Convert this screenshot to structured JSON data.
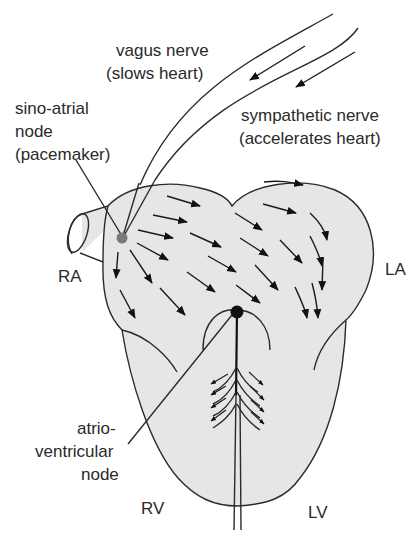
{
  "diagram": {
    "labels": {
      "vagus_line1": "vagus nerve",
      "vagus_line2": "(slows heart)",
      "sympathetic_line1": "sympathetic nerve",
      "sympathetic_line2": "(accelerates heart)",
      "sa_line1": "sino-atrial",
      "sa_line2": "node",
      "sa_line3": "(pacemaker)",
      "ra": "RA",
      "la": "LA",
      "av_line1": "atrio-",
      "av_line2": "ventricular",
      "av_line3": "node",
      "rv": "RV",
      "lv": "LV"
    },
    "colors": {
      "heart_fill": "#e6e6e6",
      "outline": "#2b2b2b",
      "sa_node": "#7a7a7a",
      "av_node": "#111111",
      "text": "#2a2a2a"
    }
  }
}
